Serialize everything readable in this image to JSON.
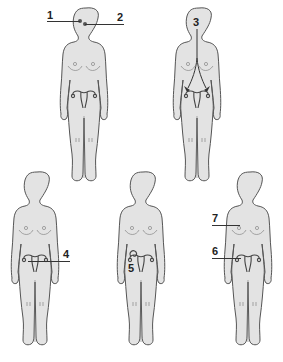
{
  "figure": {
    "colors": {
      "body_fill": "#e3e3e3",
      "outline": "#555555",
      "label": "#222222",
      "background": "#ffffff"
    }
  },
  "figures": [
    {
      "id": "top-left",
      "labels": [
        {
          "text": "1",
          "points_to": "brain-point-1"
        },
        {
          "text": "2",
          "points_to": "brain-point-2"
        }
      ]
    },
    {
      "id": "top-right",
      "labels": [
        {
          "text": "3",
          "points_to": "arrows-head-to-ovaries"
        }
      ]
    },
    {
      "id": "bottom-left",
      "labels": [
        {
          "text": "4",
          "points_to": "ovary-uterus"
        }
      ]
    },
    {
      "id": "bottom-middle",
      "labels": [
        {
          "text": "5",
          "points_to": "ovary-curl"
        }
      ]
    },
    {
      "id": "bottom-right",
      "labels": [
        {
          "text": "7",
          "points_to": "breast"
        },
        {
          "text": "6",
          "points_to": "uterus"
        }
      ]
    }
  ],
  "labels": {
    "l1": "1",
    "l2": "2",
    "l3": "3",
    "l4": "4",
    "l5": "5",
    "l6": "6",
    "l7": "7"
  }
}
